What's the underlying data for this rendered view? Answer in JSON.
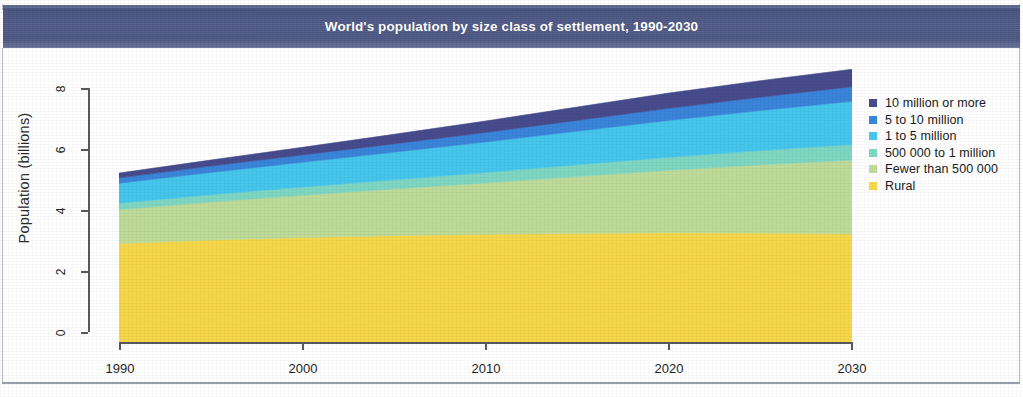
{
  "figure": {
    "title": "World's population by size class of settlement, 1990-2030",
    "banner_color": "#4e5a86",
    "background_color": "#ffffff"
  },
  "axes": {
    "y_axis_title": "Population (billions)",
    "y_ticks": [
      "0",
      "2",
      "4",
      "6",
      "8"
    ],
    "x_ticks": [
      "1990",
      "2000",
      "2010",
      "2020",
      "2030"
    ]
  },
  "legend": {
    "position": "right",
    "items": [
      {
        "label": "10 million or more",
        "color": "#474c8e"
      },
      {
        "label": "5 to 10 million",
        "color": "#3a86dd"
      },
      {
        "label": "1 to 5 million",
        "color": "#46c8ef"
      },
      {
        "label": "500 000 to 1 million",
        "color": "#7fd9c4"
      },
      {
        "label": "Fewer than 500 000",
        "color": "#c0dd9a"
      },
      {
        "label": "Rural",
        "color": "#f8d94a"
      }
    ]
  },
  "chart_data": {
    "type": "area",
    "title": "World's population by size class of settlement, 1990-2030",
    "xlabel": "",
    "ylabel": "Population (billions)",
    "xlim": [
      1990,
      2030
    ],
    "ylim": [
      0,
      8
    ],
    "grid": false,
    "legend_position": "right",
    "stacked": true,
    "stack_order_bottom_to_top": [
      "Rural",
      "Fewer than 500 000",
      "500 000 to 1 million",
      "1 to 5 million",
      "5 to 10 million",
      "10 million or more"
    ],
    "x": [
      1990,
      1995,
      2000,
      2005,
      2010,
      2015,
      2020,
      2025,
      2030
    ],
    "series": [
      {
        "name": "Rural",
        "color": "#f8d94a",
        "values": [
          3.1,
          3.21,
          3.29,
          3.35,
          3.39,
          3.42,
          3.44,
          3.43,
          3.4
        ]
      },
      {
        "name": "Fewer than 500 000",
        "color": "#c0dd9a",
        "values": [
          1.07,
          1.2,
          1.33,
          1.47,
          1.62,
          1.79,
          1.97,
          2.15,
          2.33
        ]
      },
      {
        "name": "500 000 to 1 million",
        "color": "#7fd9c4",
        "values": [
          0.2,
          0.23,
          0.26,
          0.29,
          0.33,
          0.37,
          0.41,
          0.45,
          0.49
        ]
      },
      {
        "name": "1 to 5 million",
        "color": "#46c8ef",
        "values": [
          0.63,
          0.7,
          0.78,
          0.87,
          0.96,
          1.06,
          1.16,
          1.26,
          1.36
        ]
      },
      {
        "name": "5 to 10 million",
        "color": "#3a86dd",
        "values": [
          0.17,
          0.2,
          0.23,
          0.26,
          0.3,
          0.34,
          0.38,
          0.42,
          0.46
        ]
      },
      {
        "name": "10 million or more",
        "color": "#474c8e",
        "values": [
          0.15,
          0.19,
          0.24,
          0.3,
          0.36,
          0.42,
          0.48,
          0.52,
          0.55
        ]
      }
    ],
    "totals": [
      5.32,
      5.73,
      6.13,
      6.54,
      6.96,
      7.4,
      7.84,
      8.23,
      8.59
    ]
  }
}
